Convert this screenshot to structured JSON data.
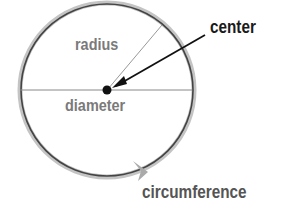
{
  "diagram": {
    "labels": {
      "radius": "radius",
      "diameter": "diameter",
      "center": "center",
      "circumference": "circumference"
    },
    "colors": {
      "circle_stroke": "#444444",
      "circle_halo": "#bdbdbd",
      "inner_label": "#7a7a7a",
      "outer_label": "#1a1a1a",
      "circumference_label": "#555555",
      "line": "#888888",
      "center_dot": "#111111"
    }
  }
}
